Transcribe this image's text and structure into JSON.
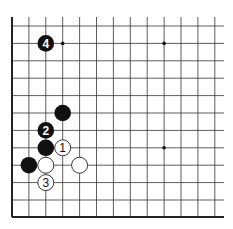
{
  "board": {
    "description": "Go board corner diagram (lower-left corner)",
    "origin_x": 12,
    "origin_y": 26,
    "spacing_x": 16.9,
    "spacing_y": 17.4,
    "cols": 13,
    "rows": 12,
    "edge_left_x": 12,
    "edge_bottom_y": 217,
    "right_x": 224,
    "top_y": 17,
    "star_points": [
      {
        "col": 3,
        "row": 2
      },
      {
        "col": 9,
        "row": 2
      },
      {
        "col": 9,
        "row": 8
      }
    ],
    "stones": [
      {
        "color": "black",
        "col": 2,
        "row": 2,
        "label": "4"
      },
      {
        "color": "black",
        "col": 3,
        "row": 6,
        "label": ""
      },
      {
        "color": "black",
        "col": 2,
        "row": 7,
        "label": "2"
      },
      {
        "color": "black",
        "col": 2,
        "row": 8,
        "label": ""
      },
      {
        "color": "white",
        "col": 3,
        "row": 8,
        "label": "1"
      },
      {
        "color": "black",
        "col": 1,
        "row": 9,
        "label": ""
      },
      {
        "color": "white",
        "col": 2,
        "row": 9,
        "label": ""
      },
      {
        "color": "white",
        "col": 4,
        "row": 9,
        "label": ""
      },
      {
        "color": "white",
        "col": 2,
        "row": 10,
        "label": "3"
      }
    ],
    "colors": {
      "line": "#333333",
      "edge": "#222222",
      "black_stone": "#111111",
      "white_stone": "#ffffff",
      "background": "#ffffff"
    }
  }
}
